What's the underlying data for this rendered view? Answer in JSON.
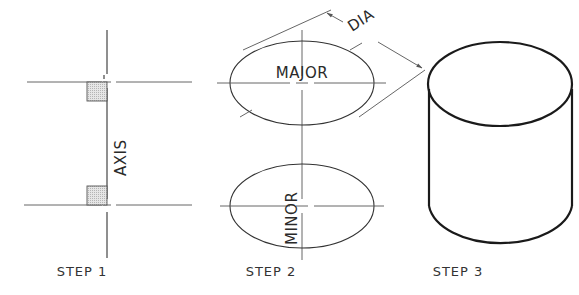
{
  "figure": {
    "steps": [
      {
        "label": "STEP 1",
        "annotation": "AXIS"
      },
      {
        "label": "STEP 2",
        "annotations": [
          "MAJOR",
          "MINOR",
          "DIA"
        ]
      },
      {
        "label": "STEP 3"
      }
    ]
  },
  "colors": {
    "line": "#333333",
    "heavy_line": "#1a1a1a",
    "shade": "#cfcfcf",
    "background": "#ffffff"
  }
}
